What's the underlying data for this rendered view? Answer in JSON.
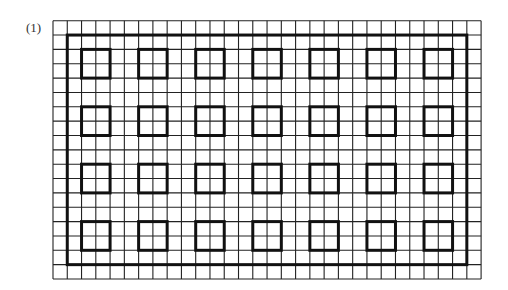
{
  "figure": {
    "label": "(1)"
  },
  "grid": {
    "origin_x": 53,
    "origin_y": 20.7,
    "cols": 30,
    "rows": 18,
    "cell_w": 14.27,
    "cell_h": 14.35,
    "line_color": "#222222",
    "line_width": 1.1
  },
  "outer_rect": {
    "col_start": 1,
    "row_start": 1,
    "col_end": 29,
    "row_end": 17,
    "color": "#111111",
    "line_width": 3
  },
  "squares": {
    "size_cells": 2,
    "col_starts": [
      2,
      6,
      10,
      14,
      18,
      22,
      26
    ],
    "row_starts": [
      2,
      6,
      10,
      14
    ],
    "color": "#111111",
    "line_width": 3
  }
}
